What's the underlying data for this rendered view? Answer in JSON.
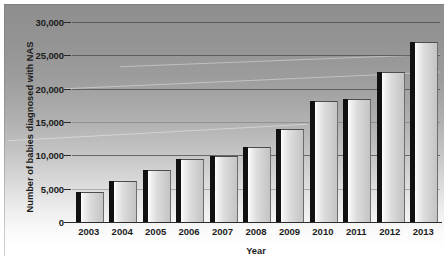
{
  "chart_data": {
    "type": "bar",
    "title": "",
    "xlabel": "Year",
    "ylabel": "Number of babies diagnosed with NAS",
    "categories": [
      "2003",
      "2004",
      "2005",
      "2006",
      "2007",
      "2008",
      "2009",
      "2010",
      "2011",
      "2012",
      "2013"
    ],
    "values": [
      4500,
      6200,
      7800,
      9400,
      9900,
      11200,
      13900,
      18100,
      18500,
      22500,
      27000
    ],
    "ylim": [
      0,
      30000
    ],
    "ytick_values": [
      0,
      5000,
      10000,
      15000,
      20000,
      25000,
      30000
    ],
    "ytick_labels": [
      "0",
      "5,000",
      "10,000",
      "15,000",
      "20,000",
      "25,000",
      "30,000"
    ],
    "grid": true,
    "legend": "none",
    "series": [
      {
        "name": "Number of babies diagnosed with NAS",
        "values": [
          4500,
          6200,
          7800,
          9400,
          9900,
          11200,
          13900,
          18100,
          18500,
          22500,
          27000
        ]
      }
    ],
    "colors": {
      "bar_face": "#d8d8d8",
      "bar_side": "#111111",
      "gridline": "#4a4a4a",
      "axis": "#2b2b2b",
      "panel_top": "#8e8e8e",
      "panel_bottom": "#ffffff",
      "text": "#1c1c1c"
    }
  }
}
